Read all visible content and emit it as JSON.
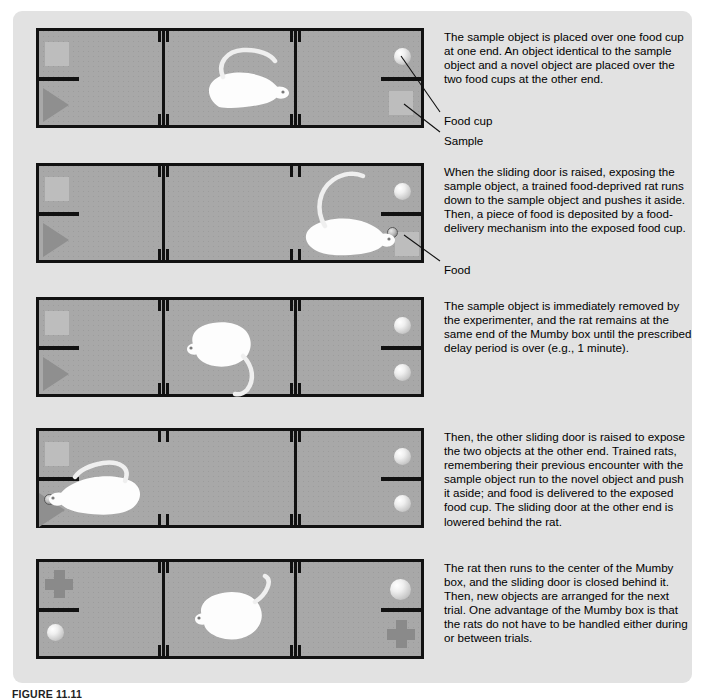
{
  "figure": {
    "caption": "FIGURE 11.11",
    "background_color": "#e2e2e2",
    "box_fill_color": "#a8a8a8",
    "box_border_color": "#111111",
    "object_color": "#8f8f8f"
  },
  "panels": [
    {
      "id": "panel-1",
      "description": "The sample object is placed over one food cup at one end. An object identical to the sample object and a novel object are placed over the two food cups at the other end.",
      "callouts": [
        {
          "label": "Food cup"
        },
        {
          "label": "Sample"
        }
      ],
      "doors": {
        "left": "closed",
        "right": "closed"
      },
      "objects": {
        "left_top": "sample-square",
        "left_bottom": "triangle",
        "right_top": "food-cup",
        "right_bottom": "sample-square"
      },
      "rat": {
        "present": true,
        "location": "center",
        "facing": "right"
      },
      "food": {
        "present": false
      }
    },
    {
      "id": "panel-2",
      "description": "When the sliding door is raised, exposing the sample object, a trained food-deprived rat runs down to the sample object and pushes it aside. Then, a piece of food is deposited by a food-delivery mechanism into the exposed food cup.",
      "callouts": [
        {
          "label": "Food"
        }
      ],
      "doors": {
        "left": "closed",
        "right": "open"
      },
      "objects": {
        "left_top": "sample-square",
        "left_bottom": "triangle",
        "right_top": "food-cup",
        "right_bottom": "sample-square-pushed-aside"
      },
      "rat": {
        "present": true,
        "location": "right-end",
        "facing": "right"
      },
      "food": {
        "present": true,
        "location": "right-bottom-cup"
      }
    },
    {
      "id": "panel-3",
      "description": "The sample object is immediately removed by the experimenter, and the rat remains at the same end of the Mumby box until the prescribed delay period is over (e.g., 1 minute).",
      "callouts": [],
      "doors": {
        "left": "closed",
        "right": "closed"
      },
      "objects": {
        "left_top": "sample-square",
        "left_bottom": "triangle",
        "right_top": "food-cup",
        "right_bottom": "food-cup"
      },
      "rat": {
        "present": true,
        "location": "center",
        "facing": "left"
      },
      "food": {
        "present": false
      }
    },
    {
      "id": "panel-4",
      "description": "Then, the other sliding door is raised to expose the two objects at the other end. Trained rats, remembering their previous encounter with the sample object run to the novel object and push it aside; and food is delivered to the exposed food cup. The sliding door at the other end is lowered behind the rat.",
      "callouts": [],
      "doors": {
        "left": "open",
        "right": "closed"
      },
      "objects": {
        "left_top": "sample-square",
        "left_bottom": "triangle-pushed-aside",
        "right_top": "food-cup",
        "right_bottom": "food-cup"
      },
      "rat": {
        "present": true,
        "location": "left-end",
        "facing": "left"
      },
      "food": {
        "present": true,
        "location": "left-bottom-cup"
      }
    },
    {
      "id": "panel-5",
      "description": "The rat then runs to the center of the Mumby box, and the sliding door is closed behind it. Then, new objects are arranged for the next trial. One advantage of the Mumby box is that the rats do not have to be handled either during or between trials.",
      "callouts": [],
      "doors": {
        "left": "closed",
        "right": "closed"
      },
      "objects": {
        "left_top": "cross",
        "left_bottom": "food-cup",
        "right_top": "food-cup",
        "right_bottom": "cross"
      },
      "rat": {
        "present": true,
        "location": "center",
        "facing": "left"
      },
      "food": {
        "present": false
      }
    }
  ]
}
